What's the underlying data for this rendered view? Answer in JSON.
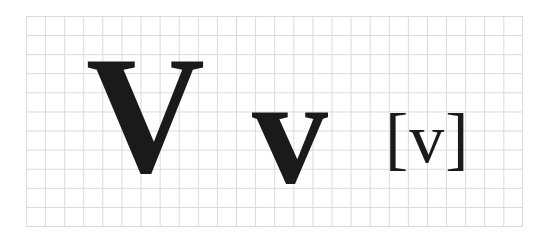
{
  "figure": {
    "uppercase": "V",
    "lowercase": "v",
    "ipa": "[v]",
    "grid_color": "#d9d9d9",
    "glyph_color": "#1a1a1a"
  }
}
